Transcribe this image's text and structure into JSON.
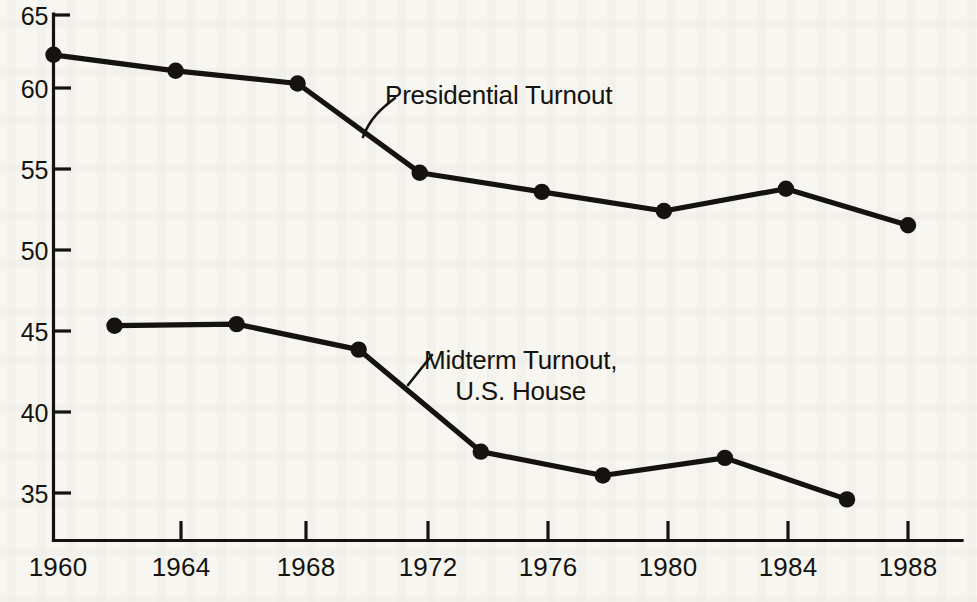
{
  "chart_data": {
    "type": "line",
    "title": "",
    "subtitle": "",
    "xlabel": "",
    "ylabel": "",
    "xlim": [
      1960,
      1990
    ],
    "ylim": [
      33,
      65
    ],
    "grid": false,
    "legend_position": "inline-annotations",
    "x_ticks": [
      "1960",
      "1964",
      "1968",
      "1972",
      "1976",
      "1980",
      "1984",
      "1988"
    ],
    "x_tick_values": [
      1960,
      1964,
      1968,
      1972,
      1976,
      1980,
      1984,
      1988
    ],
    "y_ticks": [
      "65",
      "60",
      "55",
      "50",
      "45",
      "40",
      "35"
    ],
    "y_tick_values": [
      65,
      60,
      55,
      50,
      45,
      40,
      35
    ],
    "series": [
      {
        "name": "Presidential Turnout",
        "x": [
          1960,
          1964,
          1968,
          1972,
          1976,
          1980,
          1984,
          1988
        ],
        "values": [
          62.5,
          61.5,
          60.7,
          55.1,
          53.9,
          52.7,
          54.1,
          51.8
        ],
        "marker": "filled-circle"
      },
      {
        "name": "Midterm Turnout, U.S. House",
        "x": [
          1962,
          1966,
          1970,
          1974,
          1978,
          1982,
          1986
        ],
        "values": [
          45.5,
          45.6,
          44.0,
          37.6,
          36.1,
          37.2,
          34.6
        ],
        "marker": "filled-circle"
      }
    ],
    "annotations": [
      {
        "id": "presidential",
        "line1": "Presidential Turnout",
        "line2": "",
        "points_to_x": 1970.2,
        "points_to_y": 57.8
      },
      {
        "id": "midterm",
        "line1": "Midterm Turnout,",
        "line2": "U.S. House",
        "points_to_x": 1972.1,
        "points_to_y": 41.3
      }
    ]
  },
  "colors": {
    "ink": "#15130f",
    "paper": "#f7f6f1"
  }
}
